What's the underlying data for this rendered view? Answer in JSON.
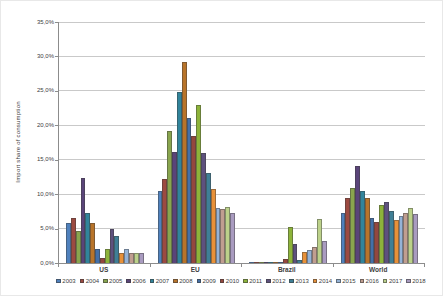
{
  "chart": {
    "ylabel": "Import share of consumption",
    "ytick_labels": [
      "35,0%",
      "30,0%",
      "25,0%",
      "20,0%",
      "15,0%",
      "10,0%",
      "5,0%",
      "0,0%"
    ]
  },
  "chart_data": {
    "type": "bar",
    "title": "",
    "ylabel": "Import share of consumption",
    "xlabel": "",
    "categories": [
      "US",
      "EU",
      "Brazil",
      "World"
    ],
    "ylim": [
      0,
      35
    ],
    "ytick_step": 5,
    "ytick_labels": [
      "35,0%",
      "30,0%",
      "25,0%",
      "20,0%",
      "15,0%",
      "10,0%",
      "5,0%",
      "0,0%"
    ],
    "grid": "horizontal",
    "legend_position": "bottom",
    "series": [
      {
        "name": "2003",
        "color": "#4F81BD",
        "values": [
          5.8,
          10.4,
          0.1,
          7.3
        ]
      },
      {
        "name": "2004",
        "color": "#9C4A41",
        "values": [
          6.5,
          12.2,
          0.1,
          9.4
        ]
      },
      {
        "name": "2005",
        "color": "#89A54E",
        "values": [
          4.7,
          19.2,
          0.1,
          10.9
        ]
      },
      {
        "name": "2006",
        "color": "#5A4479",
        "values": [
          12.4,
          16.1,
          0.1,
          14.1
        ]
      },
      {
        "name": "2007",
        "color": "#31849B",
        "values": [
          7.2,
          24.8,
          0.1,
          10.4
        ]
      },
      {
        "name": "2008",
        "color": "#B8742A",
        "values": [
          5.8,
          29.2,
          0.1,
          9.4
        ]
      },
      {
        "name": "2009",
        "color": "#4470A8",
        "values": [
          2.1,
          21.1,
          0.2,
          6.6
        ]
      },
      {
        "name": "2010",
        "color": "#94473E",
        "values": [
          0.8,
          18.5,
          0.6,
          6.0
        ]
      },
      {
        "name": "2011",
        "color": "#8DB33A",
        "values": [
          2.1,
          23.0,
          5.3,
          8.4
        ]
      },
      {
        "name": "2012",
        "color": "#5E517E",
        "values": [
          5.0,
          16.0,
          2.7,
          8.8
        ]
      },
      {
        "name": "2013",
        "color": "#3F7F96",
        "values": [
          3.9,
          13.1,
          0.4,
          7.5
        ]
      },
      {
        "name": "2014",
        "color": "#E89139",
        "values": [
          1.5,
          10.7,
          1.6,
          6.3
        ]
      },
      {
        "name": "2015",
        "color": "#95B3D7",
        "values": [
          2.0,
          8.0,
          1.9,
          6.9
        ]
      },
      {
        "name": "2016",
        "color": "#C09E90",
        "values": [
          1.5,
          7.9,
          2.3,
          7.3
        ]
      },
      {
        "name": "2017",
        "color": "#BCD18A",
        "values": [
          1.5,
          8.2,
          6.4,
          8.0
        ]
      },
      {
        "name": "2018",
        "color": "#A99BC0",
        "values": [
          1.5,
          7.3,
          3.2,
          7.1
        ]
      }
    ]
  }
}
